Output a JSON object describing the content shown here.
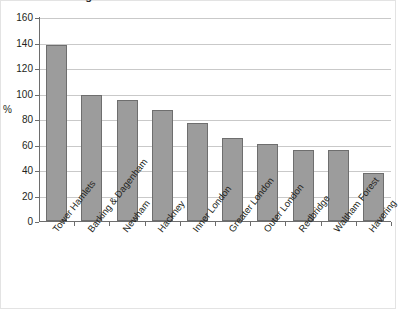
{
  "title": "London Boroughs",
  "axis": {
    "ylabel": "%",
    "yticks": [
      0,
      20,
      40,
      60,
      80,
      100,
      120,
      140,
      160
    ]
  },
  "legend": {
    "label": "% growth SEG 5.1",
    "swatch_name": "legend-swatch-seg51"
  },
  "colors": {
    "bar_fill": "#9c9c9c",
    "bar_border": "#6e6e6e",
    "gridline": "#c9c9c9",
    "axis": "#6d6d6d",
    "text": "#231f20"
  },
  "chart_data": {
    "type": "bar",
    "title": "London Boroughs",
    "xlabel": "",
    "ylabel": "%",
    "ylim": [
      0,
      160
    ],
    "ytick_step": 20,
    "grid": true,
    "legend_position": "top-right",
    "series": [
      {
        "name": "% growth SEG 5.1",
        "values": [
          138,
          99,
          95,
          87,
          77,
          65,
          60.5,
          55.5,
          55.5,
          37.5
        ]
      }
    ],
    "categories": [
      "Tower Hamlets",
      "Barking & Dagenham",
      "Newham",
      "Hackney",
      "Inner London",
      "Greater London",
      "Outer London",
      "Redbridge",
      "Waltham Forest",
      "Havering"
    ]
  }
}
